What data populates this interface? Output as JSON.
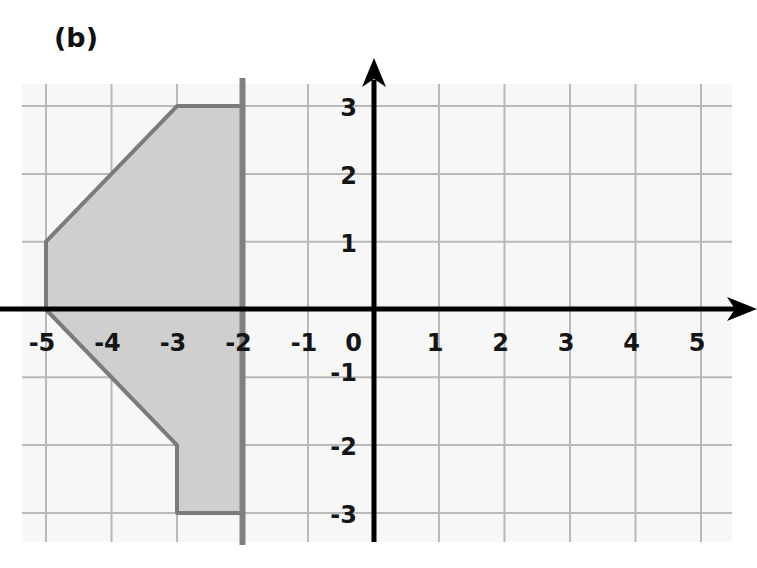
{
  "figure_label": "(b)",
  "grid": {
    "x_min": -5,
    "x_max": 5,
    "y_min": -3,
    "y_max": 3,
    "grid_color": "#b9b9b9",
    "background": "#f7f7f7"
  },
  "axes": {
    "x_ticks": [
      "-5",
      "-4",
      "-3",
      "-2",
      "-1",
      "0",
      "1",
      "2",
      "3",
      "4",
      "5"
    ],
    "y_ticks": [
      "3",
      "2",
      "1",
      "-1",
      "-2",
      "-3"
    ],
    "axis_color": "#000000"
  },
  "shape": {
    "vertices": [
      [
        -5,
        1
      ],
      [
        -3,
        3
      ],
      [
        -2,
        3
      ],
      [
        -2,
        -3
      ],
      [
        -3,
        -3
      ],
      [
        -3,
        -2
      ],
      [
        -5,
        0
      ]
    ],
    "fill": "#cfcfcf",
    "stroke": "#7b7b7b"
  },
  "mirror_line": {
    "x": -2,
    "color": "#808080"
  }
}
